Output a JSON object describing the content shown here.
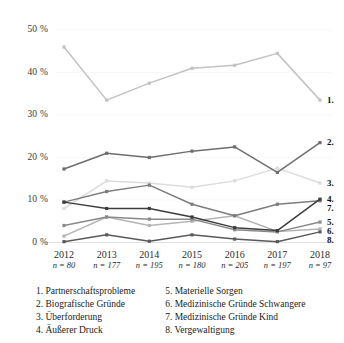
{
  "chart_data": {
    "type": "line",
    "title": "",
    "xlabel": "",
    "ylabel": "",
    "ylim": [
      0,
      50
    ],
    "yticks": [
      0,
      10,
      20,
      30,
      40,
      50
    ],
    "ytick_labels": [
      "0 %",
      "10 %",
      "20 %",
      "30 %",
      "40 %",
      "50 %"
    ],
    "grid": false,
    "legend_position": "below",
    "categories": [
      "2012",
      "2013",
      "2014",
      "2015",
      "2016",
      "2017",
      "2018"
    ],
    "sample_sizes": [
      "n = 80",
      "n = 177",
      "n = 195",
      "n = 180",
      "n = 205",
      "n = 197",
      "n = 97"
    ],
    "series": [
      {
        "id": "1",
        "name": "Partnerschaftsprobleme",
        "color": "#c2c2c2",
        "end_label": "1.",
        "values": [
          46.0,
          33.5,
          37.5,
          41.0,
          41.7,
          44.5,
          33.5
        ]
      },
      {
        "id": "2",
        "name": "Biografische Gründe",
        "color": "#6e6e6e",
        "end_label": "2.",
        "values": [
          17.3,
          21.0,
          20.0,
          21.5,
          22.5,
          16.5,
          23.5
        ]
      },
      {
        "id": "3",
        "name": "Überforderung",
        "color": "#dcdcdc",
        "end_label": "3.",
        "values": [
          8.0,
          14.5,
          14.0,
          13.0,
          14.5,
          17.5,
          14.0
        ]
      },
      {
        "id": "4",
        "name": "Äußerer Druck",
        "color": "#3d3d3d",
        "end_label": "4.",
        "values": [
          9.5,
          8.0,
          8.0,
          6.0,
          3.5,
          2.8,
          10.2
        ]
      },
      {
        "id": "5",
        "name": "Materielle Sorgen",
        "color": "#8a8a8a",
        "end_label": "5.",
        "values": [
          4.0,
          6.0,
          5.5,
          5.5,
          3.0,
          2.5,
          4.8
        ]
      },
      {
        "id": "6",
        "name": "Medizinische Gründe Schwangere",
        "color": "#b5b5b5",
        "end_label": "6.",
        "values": [
          1.5,
          6.0,
          4.0,
          5.0,
          6.3,
          2.6,
          3.2
        ]
      },
      {
        "id": "7",
        "name": "Medizinische Gründe Kind",
        "color": "#7d7d7d",
        "end_label": "7.",
        "values": [
          9.5,
          12.0,
          13.5,
          9.0,
          6.3,
          9.0,
          9.8
        ]
      },
      {
        "id": "8",
        "name": "Vergewaltigung",
        "color": "#5a5a5a",
        "end_label": "8.",
        "values": [
          0.2,
          1.8,
          0.3,
          1.8,
          0.8,
          0.2,
          2.5
        ]
      }
    ]
  },
  "legend": {
    "column_left": [
      "1. Partnerschaftsprobleme",
      "2. Biografische Gründe",
      "3. Überforderung",
      "4. Äußerer Druck"
    ],
    "column_right": [
      "5. Materielle Sorgen",
      "6. Medizinische Gründe Schwangere",
      "7. Medizinische Gründe Kind",
      "8. Vergewaltigung"
    ]
  }
}
